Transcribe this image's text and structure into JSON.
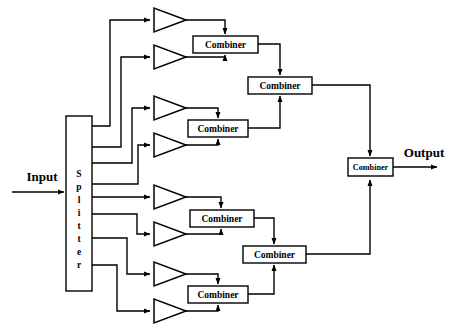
{
  "diagram": {
    "background_color": "#ffffff",
    "line_color": "#000000",
    "fill_color": "#ffffff"
  },
  "ports": {
    "input_label": "Input",
    "output_label": "Output"
  },
  "splitter": {
    "label": "Splitter",
    "letters": [
      "S",
      "p",
      "l",
      "i",
      "t",
      "t",
      "e",
      "r"
    ],
    "outputs": 8,
    "x": 66,
    "y": 116,
    "width": 26,
    "height": 175
  },
  "amplifiers": [
    {
      "name": "amplifier-1",
      "x": 152,
      "y": 20
    },
    {
      "name": "amplifier-2",
      "x": 152,
      "y": 57
    },
    {
      "name": "amplifier-3",
      "x": 152,
      "y": 108
    },
    {
      "name": "amplifier-4",
      "x": 152,
      "y": 145
    },
    {
      "name": "amplifier-5",
      "x": 152,
      "y": 197
    },
    {
      "name": "amplifier-6",
      "x": 152,
      "y": 234
    },
    {
      "name": "amplifier-7",
      "x": 152,
      "y": 274
    },
    {
      "name": "amplifier-8",
      "x": 152,
      "y": 311
    }
  ],
  "combiners": {
    "stage1": [
      {
        "name": "combiner-1a",
        "label": "Combiner",
        "cx": 225,
        "cy": 44
      },
      {
        "name": "combiner-1b",
        "label": "Combiner",
        "cx": 218,
        "cy": 128
      },
      {
        "name": "combiner-1c",
        "label": "Combiner",
        "cx": 221,
        "cy": 218
      },
      {
        "name": "combiner-1d",
        "label": "Combiner",
        "cx": 218,
        "cy": 294
      }
    ],
    "stage2": [
      {
        "name": "combiner-2a",
        "label": "Combiner",
        "cx": 280,
        "cy": 85
      },
      {
        "name": "combiner-2b",
        "label": "Combiner",
        "cx": 274,
        "cy": 254
      }
    ],
    "stage3": [
      {
        "name": "combiner-3",
        "label": "Combiner",
        "cx": 370,
        "cy": 167
      }
    ]
  },
  "counts": {
    "amplifier_count": 8,
    "stage1_combiners": 4,
    "stage2_combiners": 2,
    "stage3_combiners": 1
  }
}
